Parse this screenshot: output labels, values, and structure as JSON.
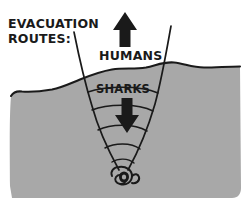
{
  "panel": {
    "title_label": "EVACUATION ROUTES:",
    "width": 245,
    "height": 202
  },
  "labels": {
    "evacuation_line1": "EVACUATION",
    "evacuation_line2": "ROUTES:",
    "humans": "HUMANS",
    "sharks": "SHARKS"
  },
  "icons": {
    "up_arrow": "up-arrow-icon",
    "down_arrow": "down-arrow-icon",
    "whirlpool": "whirlpool-icon"
  },
  "colors": {
    "water_fill": "#a8a8a8",
    "sky_fill": "#ffffff",
    "ink": "#1a1a1a",
    "funnel_line": "#1a1a1a"
  },
  "diagram": {
    "type": "hand-drawn-cross-section",
    "regions": [
      {
        "name": "sky",
        "label": "above water",
        "fill": "#ffffff"
      },
      {
        "name": "water",
        "label": "below water",
        "fill": "#a8a8a8"
      }
    ],
    "routes": [
      {
        "name": "humans-route",
        "direction": "up",
        "label": "HUMANS",
        "target": "out of the water"
      },
      {
        "name": "sharks-route",
        "direction": "down",
        "label": "SHARKS",
        "target": "whirlpool at funnel vertex"
      }
    ],
    "funnel": {
      "name": "drain-funnel",
      "arc_count": 5,
      "vertex": "whirlpool"
    }
  }
}
